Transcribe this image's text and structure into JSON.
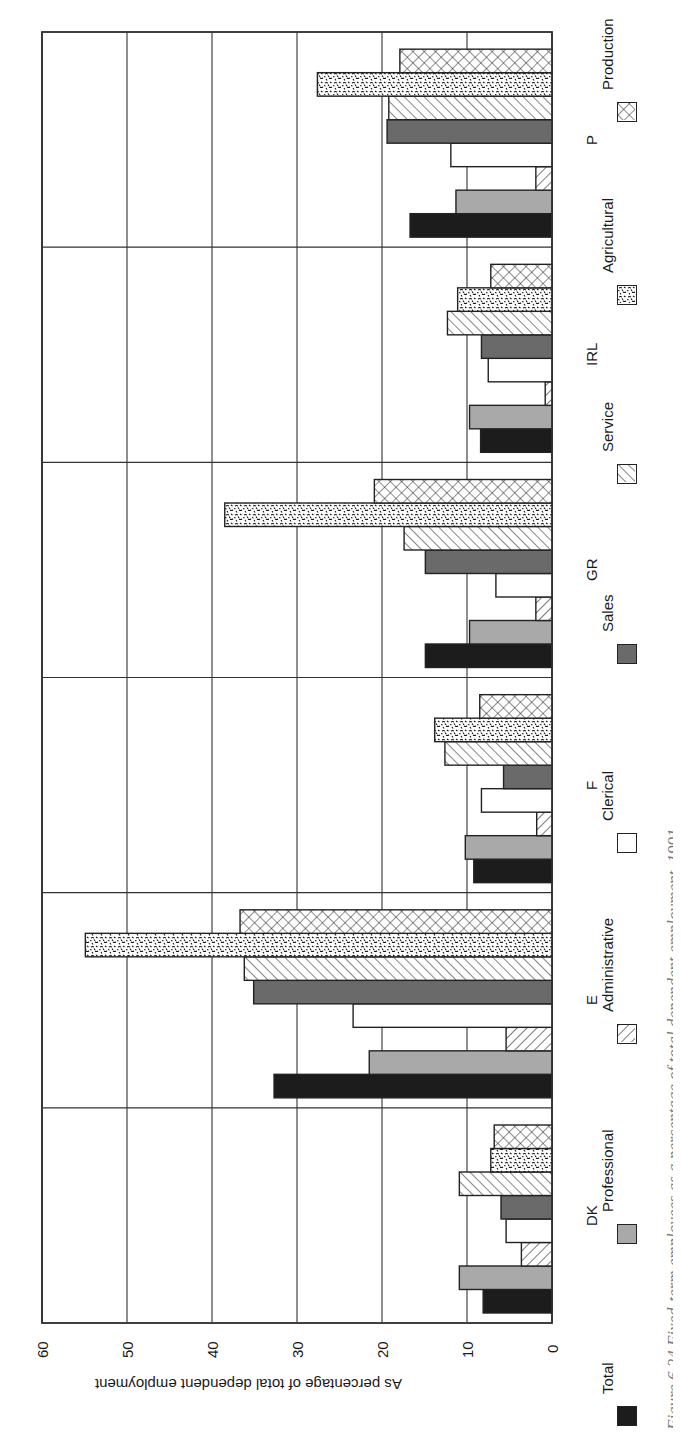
{
  "figure": {
    "caption_fragment": "Figure 6.24 Fixed-term employees as a percentage of total dependent employment, 1991"
  },
  "chart_data": {
    "type": "bar",
    "orientation": "rotated 90° (bars drawn horizontally, page read sideways)",
    "title": "",
    "xlabel": "",
    "ylabel": "As percentage of total dependent employment",
    "ylim": [
      0,
      60
    ],
    "yticks": [
      "0",
      "10",
      "20",
      "30",
      "40",
      "50",
      "60"
    ],
    "grid": true,
    "legend_position": "bottom",
    "categories": [
      "DK",
      "E",
      "F",
      "GR",
      "IRL",
      "P"
    ],
    "series": [
      {
        "name": "Total",
        "values": [
          8.1,
          32.7,
          9.2,
          14.9,
          8.4,
          16.7
        ]
      },
      {
        "name": "Professional",
        "values": [
          10.9,
          21.5,
          10.2,
          9.7,
          9.7,
          11.3
        ]
      },
      {
        "name": "Administrative",
        "values": [
          3.6,
          5.4,
          1.8,
          1.9,
          0.8,
          1.9
        ]
      },
      {
        "name": "Clerical",
        "values": [
          5.4,
          23.4,
          8.3,
          6.6,
          7.5,
          11.9
        ]
      },
      {
        "name": "Sales",
        "values": [
          6.0,
          35.1,
          5.7,
          14.9,
          8.3,
          19.4
        ]
      },
      {
        "name": "Service",
        "values": [
          10.9,
          36.2,
          12.6,
          17.4,
          12.3,
          19.2
        ]
      },
      {
        "name": "Agricultural",
        "values": [
          7.2,
          54.9,
          13.8,
          38.5,
          11.1,
          27.6
        ]
      },
      {
        "name": "Production",
        "values": [
          6.8,
          36.7,
          8.5,
          20.9,
          7.2,
          17.9
        ]
      }
    ]
  },
  "legend": {
    "items": [
      {
        "label": "Total",
        "pattern": "solid-black"
      },
      {
        "label": "Professional",
        "pattern": "light-gray"
      },
      {
        "label": "Administrative",
        "pattern": "backslash-hatch"
      },
      {
        "label": "Clerical",
        "pattern": "white"
      },
      {
        "label": "Sales",
        "pattern": "dark-gray"
      },
      {
        "label": "Service",
        "pattern": "slash-hatch"
      },
      {
        "label": "Agricultural",
        "pattern": "speckle"
      },
      {
        "label": "Production",
        "pattern": "crosshatch"
      }
    ]
  },
  "colors": {
    "total": "#1c1c1c",
    "professional": "#a9a9a9",
    "sales": "#6a6a6a",
    "outline": "#222222",
    "grid": "#333333"
  }
}
